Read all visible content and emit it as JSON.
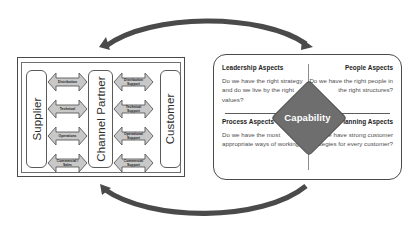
{
  "diagram": {
    "colors": {
      "arc": "#4a4a4a",
      "flow_arrow_fill": "#c8c8c8",
      "flow_arrow_stroke": "#5a5a5a",
      "diamond_fill": "#6e6e6e",
      "box_stroke": "#4a4a4a",
      "heading_text": "#1d1d1d",
      "body_text": "#4f4f4f"
    },
    "cycle_arrows": [
      {
        "name": "top-arc",
        "direction": "left-and-right",
        "description": "curved arc above both boxes with arrowheads at each end"
      },
      {
        "name": "bottom-arc",
        "direction": "left",
        "description": "curved arc below both boxes with arrowhead at left end"
      }
    ],
    "left_model": {
      "parties": [
        {
          "id": "supplier",
          "label": "Supplier"
        },
        {
          "id": "channel-partner",
          "label": "Channel Partner"
        },
        {
          "id": "customer",
          "label": "Customer"
        }
      ],
      "supplier_to_partner_flows": [
        {
          "label": "Distribution"
        },
        {
          "label": "Technical"
        },
        {
          "label": "Operations"
        },
        {
          "label": "Commercial /\nSales"
        }
      ],
      "partner_to_customer_flows": [
        {
          "label": "Distribution\nSupport"
        },
        {
          "label": "Technical\nSupport"
        },
        {
          "label": "Operational\nSupport"
        },
        {
          "label": "Commercial\nSupport"
        }
      ]
    },
    "right_panel": {
      "center": {
        "label": "Capability"
      },
      "quadrants": [
        {
          "id": "leadership",
          "heading": "Leadership Aspects",
          "question": "Do we have the right strategy and do we live by the right values?"
        },
        {
          "id": "people",
          "heading": "People Aspects",
          "question": "Do we have the right people in the right structures?"
        },
        {
          "id": "process",
          "heading": "Process Aspects",
          "question": "Do we have the most appropriate ways of working?"
        },
        {
          "id": "planning",
          "heading": "Planning Aspects",
          "question": "Do we have strong customer strategies for every customer?"
        }
      ]
    }
  }
}
